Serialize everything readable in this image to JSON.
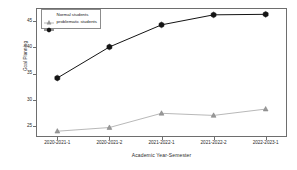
{
  "chart_data": {
    "type": "line",
    "title": "",
    "xlabel": "Academic Year-Semester",
    "ylabel": "Goal Planning",
    "categories": [
      "2020-2021-1",
      "2020-2021-2",
      "2021-2022-1",
      "2021-2022-2",
      "2022-2023-1"
    ],
    "ylim": [
      23.0,
      47.5
    ],
    "yticks": [
      25,
      30,
      35,
      40,
      45
    ],
    "grid": false,
    "legend_position": "top-left",
    "series": [
      {
        "name": "Normal students",
        "values": [
          24.1,
          24.8,
          27.5,
          27.1,
          28.3
        ],
        "color": "#9a9a9a",
        "marker": "triangle"
      },
      {
        "name": "problematic students",
        "values": [
          34.2,
          40.1,
          44.3,
          46.2,
          46.3
        ],
        "color": "#141414",
        "marker": "hexagon"
      }
    ]
  },
  "axes": {
    "ylabel": "Goal Planning",
    "xlabel": "Academic Year-Semester",
    "ytick_labels": [
      "45",
      "40",
      "35",
      "30",
      "25"
    ],
    "xtick_labels": [
      "2020-2021-1",
      "2020-2021-2",
      "2021-2022-1",
      "2021-2022-2",
      "2022-2023-1"
    ]
  },
  "legend": {
    "items": [
      {
        "label": "Normal students",
        "marker": "triangle-icon"
      },
      {
        "label": "problematic students",
        "marker": "hexagon-icon"
      }
    ]
  },
  "colors": {
    "normal_series": "#9a9a9a",
    "problematic_series": "#141414",
    "frame": "#6e6e6e",
    "background": "#ffffff"
  }
}
